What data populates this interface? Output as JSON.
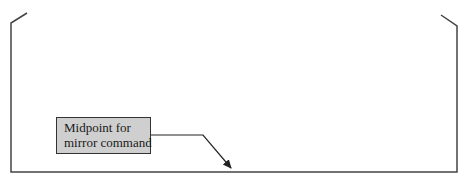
{
  "diagram": {
    "callout": {
      "line1": "Midpoint for",
      "line2": "mirror command"
    },
    "colors": {
      "stroke": "#444444",
      "callout_fill": "#cfcfcf",
      "callout_border": "#333333",
      "text": "#1a1a1a"
    }
  }
}
